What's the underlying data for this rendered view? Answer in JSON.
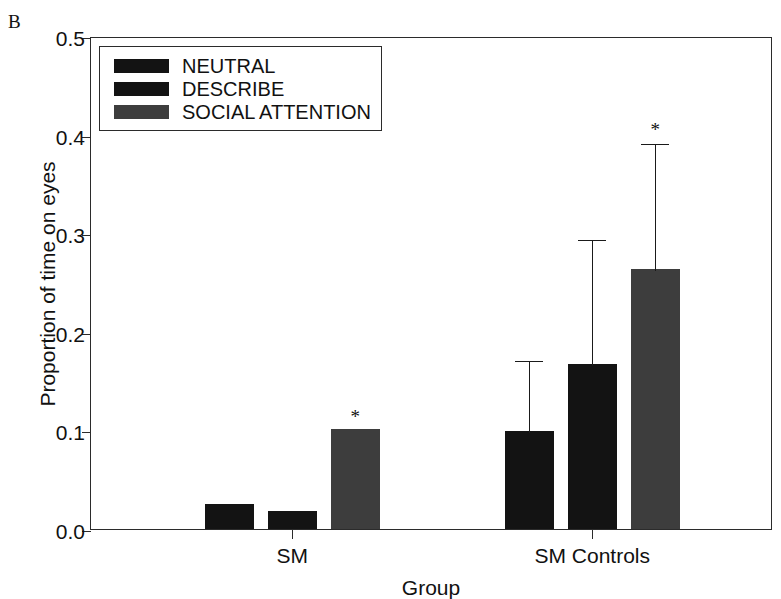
{
  "panel": {
    "letter": "B"
  },
  "legend": {
    "entries": [
      {
        "label": "NEUTRAL",
        "color": "#131313"
      },
      {
        "label": "DESCRIBE",
        "color": "#131313"
      },
      {
        "label": "SOCIAL ATTENTION",
        "color": "#3d3d3d"
      }
    ]
  },
  "axes": {
    "ylabel": "Proportion of time on eyes",
    "xlabel": "Group",
    "yticks": [
      "0.0",
      "0.1",
      "0.2",
      "0.3",
      "0.4",
      "0.5"
    ],
    "xticks": [
      "SM",
      "SM Controls"
    ]
  },
  "significance": {
    "marker": "*"
  },
  "chart_data": {
    "type": "bar",
    "title": "",
    "xlabel": "Group",
    "ylabel": "Proportion of time on eyes",
    "ylim": [
      0.0,
      0.5
    ],
    "ytick_values": [
      0.0,
      0.1,
      0.2,
      0.3,
      0.4,
      0.5
    ],
    "grid": false,
    "legend_position": "upper-left-inside",
    "categories": [
      "SM",
      "SM Controls"
    ],
    "series": [
      {
        "name": "NEUTRAL",
        "color": "#131313",
        "values": [
          0.025,
          0.099
        ],
        "error_upper": [
          null,
          0.073
        ],
        "significant": [
          false,
          false
        ]
      },
      {
        "name": "DESCRIBE",
        "color": "#131313",
        "values": [
          0.018,
          0.167
        ],
        "error_upper": [
          null,
          0.128
        ],
        "significant": [
          false,
          false
        ]
      },
      {
        "name": "SOCIAL ATTENTION",
        "color": "#3d3d3d",
        "values": [
          0.101,
          0.264
        ],
        "error_upper": [
          null,
          0.129
        ],
        "significant": [
          true,
          true
        ]
      }
    ],
    "annotations": [
      {
        "text": "*",
        "category": "SM",
        "series": "SOCIAL ATTENTION"
      },
      {
        "text": "*",
        "category": "SM Controls",
        "series": "SOCIAL ATTENTION"
      }
    ]
  }
}
